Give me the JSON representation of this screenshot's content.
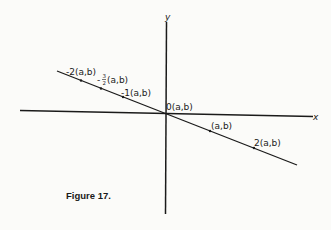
{
  "figure": {
    "caption": "Figure 17.",
    "axes": {
      "x_label": "x",
      "y_label": "y"
    },
    "line_points": [
      {
        "label": "-2(a,b)",
        "scalar": -2
      },
      {
        "label": "-½(a,b)",
        "scalar": -1.5,
        "display_prefix": "-",
        "fraction": "3/2",
        "suffix": "(a,b)"
      },
      {
        "label": "-1(a,b)",
        "scalar": -1
      },
      {
        "label": "0(a,b)",
        "scalar": 0
      },
      {
        "label": "(a,b)",
        "scalar": 1
      },
      {
        "label": "2(a,b)",
        "scalar": 2
      }
    ],
    "frac": {
      "num": "3",
      "den": "2"
    },
    "colors": {
      "ink": "#1a1a1a",
      "paper": "#fbfbf9"
    }
  }
}
